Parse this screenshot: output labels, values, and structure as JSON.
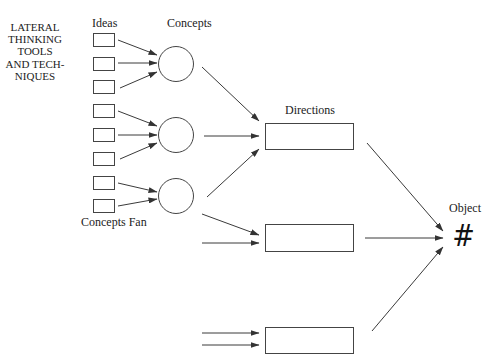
{
  "title_block": {
    "lines": [
      "LATERAL",
      "THINKING",
      "TOOLS",
      "AND TECH-",
      "NIQUES"
    ]
  },
  "labels": {
    "ideas": "Ideas",
    "concepts": "Concepts",
    "concepts_fan": "Concepts Fan",
    "directions": "Directions",
    "object": "Object",
    "object_symbol": "#"
  },
  "colors": {
    "stroke": "#444444",
    "text": "#222222",
    "background": "#ffffff"
  },
  "nodes": {
    "ideas": [
      {
        "x": 93,
        "y": 33,
        "w": 21,
        "h": 13
      },
      {
        "x": 93,
        "y": 57,
        "w": 21,
        "h": 13
      },
      {
        "x": 93,
        "y": 80,
        "w": 21,
        "h": 13
      },
      {
        "x": 93,
        "y": 104,
        "w": 21,
        "h": 13
      },
      {
        "x": 93,
        "y": 128,
        "w": 21,
        "h": 13
      },
      {
        "x": 93,
        "y": 152,
        "w": 21,
        "h": 13
      },
      {
        "x": 93,
        "y": 176,
        "w": 21,
        "h": 13
      },
      {
        "x": 93,
        "y": 199,
        "w": 21,
        "h": 13
      }
    ],
    "concepts": [
      {
        "cx": 176,
        "cy": 64,
        "r": 17.5
      },
      {
        "cx": 176,
        "cy": 135,
        "r": 17.5
      },
      {
        "cx": 176,
        "cy": 196,
        "r": 17.5
      }
    ],
    "directions": [
      {
        "x": 265,
        "y": 123,
        "w": 88,
        "h": 26
      },
      {
        "x": 265,
        "y": 224,
        "w": 88,
        "h": 27
      },
      {
        "x": 265,
        "y": 327,
        "w": 88,
        "h": 26
      }
    ]
  },
  "edges": [
    {
      "from": "idea-1",
      "to": "concept-1",
      "x1": 118,
      "y1": 40,
      "x2": 157,
      "y2": 55
    },
    {
      "from": "idea-2",
      "to": "concept-1",
      "x1": 118,
      "y1": 63,
      "x2": 157,
      "y2": 63
    },
    {
      "from": "idea-3",
      "to": "concept-1",
      "x1": 120,
      "y1": 88,
      "x2": 157,
      "y2": 72
    },
    {
      "from": "idea-4",
      "to": "concept-2",
      "x1": 118,
      "y1": 111,
      "x2": 157,
      "y2": 126
    },
    {
      "from": "idea-5",
      "to": "concept-2",
      "x1": 118,
      "y1": 135,
      "x2": 157,
      "y2": 135
    },
    {
      "from": "idea-6",
      "to": "concept-2",
      "x1": 120,
      "y1": 159,
      "x2": 157,
      "y2": 143
    },
    {
      "from": "idea-7",
      "to": "concept-3",
      "x1": 118,
      "y1": 183,
      "x2": 157,
      "y2": 192
    },
    {
      "from": "idea-8",
      "to": "concept-3",
      "x1": 118,
      "y1": 206,
      "x2": 157,
      "y2": 199
    },
    {
      "from": "concept-1",
      "to": "direction-1",
      "x1": 202,
      "y1": 67,
      "x2": 259,
      "y2": 121
    },
    {
      "from": "concept-2",
      "to": "direction-1",
      "x1": 204,
      "y1": 136,
      "x2": 259,
      "y2": 136
    },
    {
      "from": "concept-3",
      "to": "direction-1",
      "x1": 207,
      "y1": 197,
      "x2": 259,
      "y2": 149
    },
    {
      "from": "concept-3",
      "to": "direction-2",
      "x1": 202,
      "y1": 214,
      "x2": 259,
      "y2": 235
    },
    {
      "from": "external",
      "to": "direction-2",
      "x1": 202,
      "y1": 243,
      "x2": 259,
      "y2": 243
    },
    {
      "from": "external",
      "to": "direction-3",
      "x1": 202,
      "y1": 333,
      "x2": 259,
      "y2": 333
    },
    {
      "from": "external",
      "to": "direction-3",
      "x1": 202,
      "y1": 345,
      "x2": 259,
      "y2": 345
    },
    {
      "from": "direction-1",
      "to": "object",
      "x1": 367,
      "y1": 143,
      "x2": 443,
      "y2": 231
    },
    {
      "from": "direction-2",
      "to": "object",
      "x1": 365,
      "y1": 238,
      "x2": 443,
      "y2": 238
    },
    {
      "from": "direction-3",
      "to": "object",
      "x1": 372,
      "y1": 331,
      "x2": 443,
      "y2": 247
    }
  ]
}
